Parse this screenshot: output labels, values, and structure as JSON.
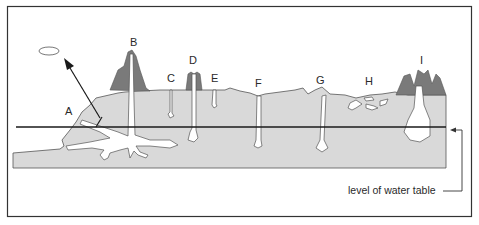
{
  "figure": {
    "type": "cross-section diagram",
    "colors": {
      "rock": "#d9d9d9",
      "outcrop": "#7a7a7a",
      "outline": "#555555",
      "water_table_line": "#1a1a1a",
      "frame": "#333333",
      "background": "#ffffff"
    },
    "labels": {
      "A": "A",
      "B": "B",
      "C": "C",
      "D": "D",
      "E": "E",
      "F": "F",
      "G": "G",
      "H": "H",
      "I": "I"
    },
    "caption": {
      "water_table": "level of water table"
    }
  }
}
